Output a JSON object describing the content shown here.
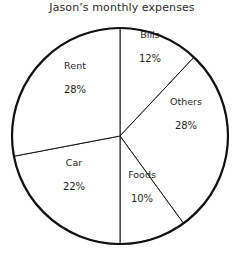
{
  "chart_data": {
    "type": "pie",
    "title": "Jason’s monthly expenses",
    "xlabel": "",
    "ylabel": "",
    "legend": "none",
    "grid": false,
    "value_suffix": "%",
    "start_angle_deg": 0,
    "direction": "clockwise",
    "categories": [
      "Bills",
      "Others",
      "Foods",
      "Car",
      "Rent"
    ],
    "values": [
      12,
      28,
      10,
      22,
      28
    ],
    "total": 100,
    "slices": [
      {
        "name": "Bills",
        "value": 12,
        "value_label": "12%",
        "start_deg": 0,
        "end_deg": 43.2,
        "label_x": 150,
        "label_y": 46,
        "fill": "#ffffff",
        "stroke": "#151515"
      },
      {
        "name": "Others",
        "value": 28,
        "value_label": "28%",
        "start_deg": 43.2,
        "end_deg": 144.0,
        "label_x": 186,
        "label_y": 113,
        "fill": "#ffffff",
        "stroke": "#151515"
      },
      {
        "name": "Foods",
        "value": 10,
        "value_label": "10%",
        "start_deg": 144.0,
        "end_deg": 180.0,
        "label_x": 142,
        "label_y": 186,
        "fill": "#ffffff",
        "stroke": "#151515"
      },
      {
        "name": "Car",
        "value": 22,
        "value_label": "22%",
        "start_deg": 180.0,
        "end_deg": 259.2,
        "label_x": 74,
        "label_y": 174,
        "fill": "#ffffff",
        "stroke": "#151515"
      },
      {
        "name": "Rent",
        "value": 28,
        "value_label": "28%",
        "start_deg": 259.2,
        "end_deg": 360.0,
        "label_x": 75,
        "label_y": 77,
        "fill": "#ffffff",
        "stroke": "#151515"
      }
    ],
    "geometry": {
      "center_x": 120,
      "center_y": 136,
      "radius": 108
    },
    "colors": {
      "background": "#ffffff",
      "outline": "#111111",
      "divider": "#151515",
      "text": "#1f1f1f",
      "title_text": "#2b2b2b"
    }
  }
}
